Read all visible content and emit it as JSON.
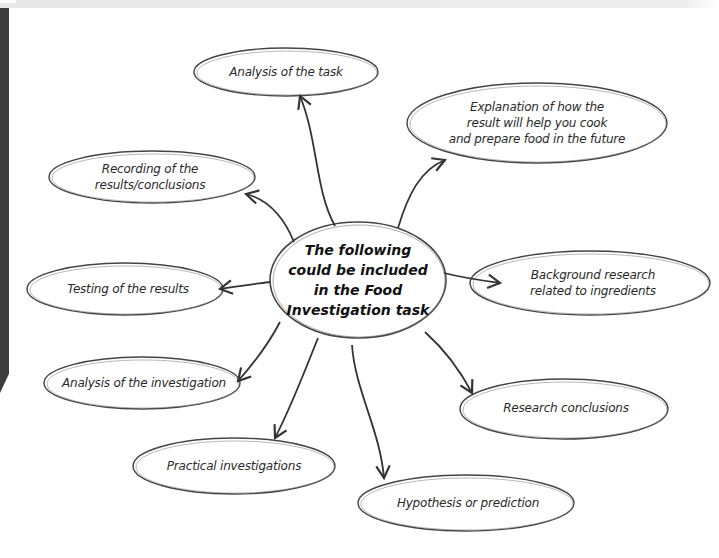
{
  "diagram": {
    "type": "mind-map",
    "central": {
      "label": "The following\ncould be included\nin the Food\nInvestigation task"
    },
    "nodes": [
      {
        "id": "analysis-task",
        "label": "Analysis of the task"
      },
      {
        "id": "explanation",
        "label": "Explanation of how the\nresult will help you cook\nand prepare food in the future"
      },
      {
        "id": "recording",
        "label": "Recording of the\nresults/conclusions"
      },
      {
        "id": "background",
        "label": "Background research\nrelated to ingredients"
      },
      {
        "id": "testing",
        "label": "Testing of the results"
      },
      {
        "id": "analysis-investigation",
        "label": "Analysis of the investigation"
      },
      {
        "id": "research-conclusions",
        "label": "Research conclusions"
      },
      {
        "id": "practical",
        "label": "Practical investigations"
      },
      {
        "id": "hypothesis",
        "label": "Hypothesis or prediction"
      }
    ],
    "edges": [
      {
        "from": "central",
        "to": "analysis-task"
      },
      {
        "from": "central",
        "to": "explanation"
      },
      {
        "from": "central",
        "to": "recording"
      },
      {
        "from": "central",
        "to": "background"
      },
      {
        "from": "central",
        "to": "testing"
      },
      {
        "from": "central",
        "to": "analysis-investigation"
      },
      {
        "from": "central",
        "to": "research-conclusions"
      },
      {
        "from": "central",
        "to": "practical"
      },
      {
        "from": "central",
        "to": "hypothesis"
      }
    ]
  },
  "colors": {
    "stroke": "#333333",
    "text": "#2a2a2a",
    "side_bar": "#3c3c3c",
    "top_strip": "#e8e8e8"
  }
}
